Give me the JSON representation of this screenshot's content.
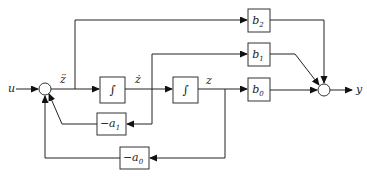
{
  "diagram": {
    "type": "block-diagram",
    "signals": {
      "input": "u",
      "output": "y",
      "zdd": "z̈",
      "zd": "ż",
      "z": "z"
    },
    "blocks": {
      "integrator1": "∫",
      "integrator2": "∫",
      "b2": {
        "base": "b",
        "sub": "2"
      },
      "b1": {
        "base": "b",
        "sub": "1"
      },
      "b0": {
        "base": "b",
        "sub": "0"
      },
      "neg_a1": {
        "base": "−a",
        "sub": "1"
      },
      "neg_a0": {
        "base": "−a",
        "sub": "0"
      }
    },
    "junctions": [
      "input-summing-junction",
      "output-summing-junction"
    ],
    "colors": {
      "line": "#222222",
      "background": "#ffffff"
    }
  }
}
